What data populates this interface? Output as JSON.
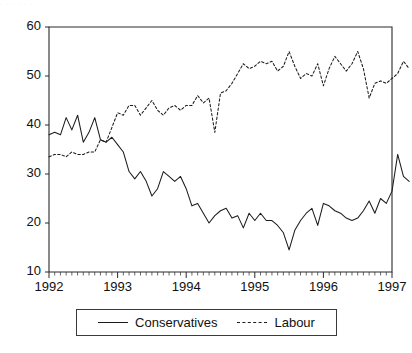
{
  "top_strip": {
    "text": "· ·   ·     ·    ·                              ·"
  },
  "legend": {
    "position": "bottom-center-boxed",
    "entries": [
      {
        "label": "Conservatives",
        "style": "solid",
        "swatch_name": "legend-swatch-solid"
      },
      {
        "label": "Labour",
        "style": "dotted",
        "swatch_name": "legend-swatch-dotted"
      }
    ]
  },
  "chart_data": {
    "type": "line",
    "title": "",
    "subtitle": "",
    "xlabel": "",
    "ylabel": "",
    "xlim": [
      1992.0,
      1997.0
    ],
    "ylim": [
      10,
      60
    ],
    "yticks": [
      10,
      20,
      30,
      40,
      50,
      60
    ],
    "ytick_labels": [
      "10",
      "20",
      "30",
      "40",
      "50",
      "60"
    ],
    "xticks": [
      1992,
      1993,
      1994,
      1995,
      1996,
      1997
    ],
    "xtick_labels": [
      "1992",
      "1993",
      "1994",
      "1995",
      "1996",
      "1997"
    ],
    "x_minor_ticks_per_year": 12,
    "grid": false,
    "legend_position": "below-axes",
    "x": [
      1992.0,
      1992.083,
      1992.167,
      1992.25,
      1992.333,
      1992.417,
      1992.5,
      1992.583,
      1992.667,
      1992.75,
      1992.833,
      1992.917,
      1993.0,
      1993.083,
      1993.167,
      1993.25,
      1993.333,
      1993.417,
      1993.5,
      1993.583,
      1993.667,
      1993.75,
      1993.833,
      1993.917,
      1994.0,
      1994.083,
      1994.167,
      1994.25,
      1994.333,
      1994.417,
      1994.5,
      1994.583,
      1994.667,
      1994.75,
      1994.833,
      1994.917,
      1995.0,
      1995.083,
      1995.167,
      1995.25,
      1995.333,
      1995.417,
      1995.5,
      1995.583,
      1995.667,
      1995.75,
      1995.833,
      1995.917,
      1996.0,
      1996.083,
      1996.167,
      1996.25,
      1996.333,
      1996.417,
      1996.5,
      1996.583,
      1996.667,
      1996.75,
      1996.833,
      1996.917,
      1997.0,
      1997.083,
      1997.167,
      1997.25
    ],
    "series": [
      {
        "name": "Conservatives",
        "style": "solid",
        "values": [
          38.0,
          38.5,
          38.0,
          41.5,
          39.0,
          42.0,
          36.5,
          38.5,
          41.5,
          37.0,
          36.5,
          37.5,
          36.0,
          34.5,
          30.5,
          29.0,
          30.5,
          28.5,
          25.5,
          27.0,
          30.5,
          29.5,
          28.5,
          29.5,
          27.0,
          23.5,
          24.0,
          22.0,
          20.0,
          21.5,
          22.5,
          23.0,
          21.0,
          21.5,
          19.0,
          22.0,
          20.5,
          22.0,
          20.5,
          20.5,
          19.5,
          18.0,
          14.5,
          18.5,
          20.5,
          22.0,
          23.0,
          19.5,
          24.0,
          23.5,
          22.5,
          22.0,
          21.0,
          20.5,
          21.0,
          22.5,
          24.5,
          22.0,
          25.0,
          24.0,
          26.5,
          34.0,
          29.5,
          28.5
        ]
      },
      {
        "name": "Labour",
        "style": "dotted",
        "values": [
          33.5,
          34.0,
          34.0,
          33.5,
          34.5,
          34.0,
          34.0,
          34.5,
          34.5,
          37.0,
          36.5,
          39.5,
          42.5,
          42.0,
          44.0,
          44.0,
          42.0,
          43.5,
          45.0,
          43.0,
          42.0,
          43.5,
          44.0,
          43.0,
          44.0,
          44.0,
          46.0,
          44.5,
          45.5,
          38.5,
          46.5,
          47.0,
          48.5,
          50.5,
          52.5,
          51.5,
          52.0,
          53.0,
          52.5,
          53.0,
          51.0,
          52.0,
          55.0,
          52.0,
          49.5,
          50.5,
          50.0,
          52.5,
          48.0,
          51.5,
          54.0,
          52.5,
          51.0,
          52.5,
          55.0,
          51.5,
          45.5,
          48.5,
          49.0,
          48.5,
          49.5,
          50.5,
          53.0,
          51.5
        ]
      }
    ]
  },
  "colors": {
    "axis": "#2a2a2a",
    "series_conservatives": "#1c1c1c",
    "series_labour": "#1c1c1c",
    "background": "#ffffff"
  }
}
